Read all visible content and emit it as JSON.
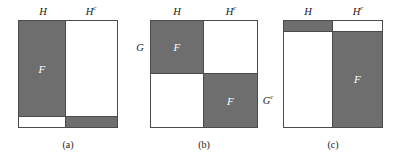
{
  "figure": {
    "background": "#ffffff",
    "gray": "#6e6e6e",
    "white": "#ffffff",
    "stroke": "#4a4a4a"
  },
  "panels": [
    {
      "id": "a",
      "caption": "(a)",
      "col_labels": {
        "left": "H",
        "right": "H",
        "right_sup": "c"
      },
      "row_labels": {
        "left": "",
        "right": ""
      },
      "regions": [
        {
          "name": "upper-left",
          "fill": "gray",
          "label": "F"
        },
        {
          "name": "upper-right",
          "fill": "white",
          "label": ""
        },
        {
          "name": "lower-left",
          "fill": "white",
          "label": ""
        },
        {
          "name": "lower-right",
          "fill": "gray",
          "label": ""
        }
      ],
      "split_x_pct": 48,
      "split_y_pct": 90
    },
    {
      "id": "b",
      "caption": "(b)",
      "col_labels": {
        "left": "H",
        "right": "H",
        "right_sup": "c"
      },
      "row_labels": {
        "left": "G",
        "left_sup": "",
        "right": "G",
        "right_sup": "c"
      },
      "regions": [
        {
          "name": "upper-left",
          "fill": "gray",
          "label": "F"
        },
        {
          "name": "upper-right",
          "fill": "white",
          "label": ""
        },
        {
          "name": "lower-left",
          "fill": "white",
          "label": ""
        },
        {
          "name": "lower-right",
          "fill": "gray",
          "label": "F"
        }
      ],
      "split_x_pct": 50,
      "split_y_pct": 50
    },
    {
      "id": "c",
      "caption": "(c)",
      "col_labels": {
        "left": "H",
        "right": "H",
        "right_sup": "c"
      },
      "row_labels": {
        "left": "",
        "right": ""
      },
      "regions": [
        {
          "name": "upper-left",
          "fill": "gray",
          "label": ""
        },
        {
          "name": "upper-right",
          "fill": "white",
          "label": ""
        },
        {
          "name": "lower-left",
          "fill": "white",
          "label": ""
        },
        {
          "name": "lower-right",
          "fill": "gray",
          "label": "F"
        }
      ],
      "split_x_pct": 50,
      "split_y_pct": 10
    }
  ]
}
